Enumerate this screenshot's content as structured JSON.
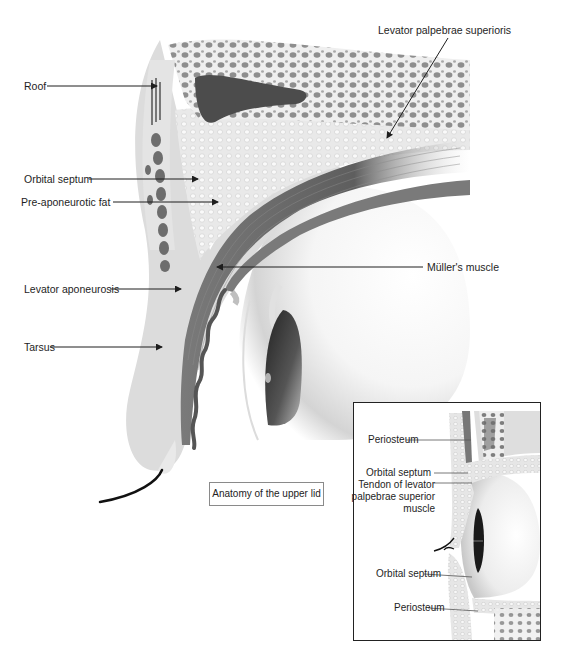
{
  "figure": {
    "title": "Anatomy of  the upper lid",
    "main_labels": {
      "roof": "Roof",
      "levator_palpebrae_superioris": "Levator palpebrae superioris",
      "orbital_septum": "Orbital septum",
      "pre_aponeurotic_fat": "Pre-aponeurotic fat",
      "mullers_muscle": "Müller's muscle",
      "levator_aponeurosis": "Levator aponeurosis",
      "tarsus": "Tarsus"
    },
    "inset_labels": {
      "periosteum_top": "Periosteum",
      "orbital_septum_top": "Orbital septum",
      "tendon_line1": "Tendon of levator",
      "tendon_line2": "palpebrae superior",
      "tendon_line3": "muscle",
      "orbital_septum_bottom": "Orbital septum",
      "periosteum_bottom": "Periosteum"
    }
  },
  "colors": {
    "background": "#ffffff",
    "bone_light": "#e6e6e6",
    "bone_cell": "#9a9a9a",
    "sinus_dark": "#4a4a4a",
    "muscle": "#6e6e6e",
    "tarsus": "#5a5a5a",
    "lens_dark": "#2a2a2a",
    "line": "#1e1e1e"
  }
}
